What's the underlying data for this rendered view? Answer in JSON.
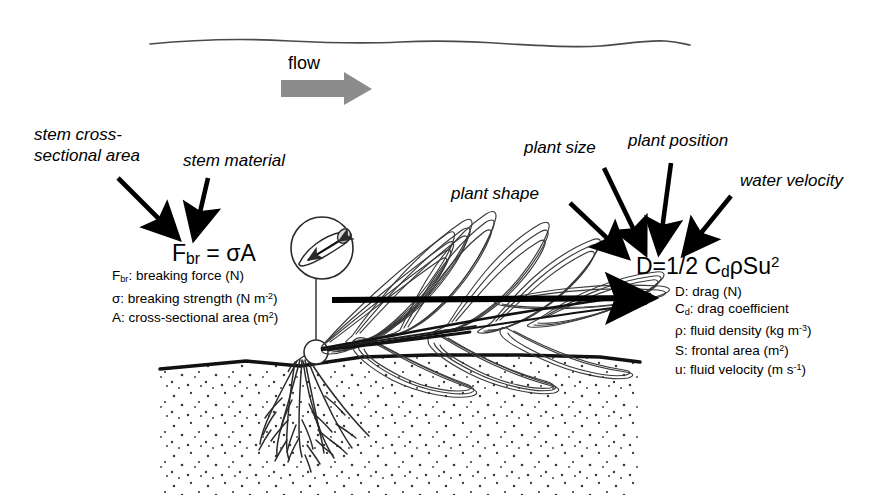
{
  "figure": {
    "background_color": "#ffffff",
    "ink_color": "#000000",
    "flow_arrow_color": "#8c8c8c"
  },
  "flow": {
    "label": "flow",
    "direction": "left-to-right",
    "arrow_name": "flow-arrow"
  },
  "water_surface": {
    "name": "water-surface-line",
    "description": "wavy free surface"
  },
  "substrate": {
    "name": "sediment-bed",
    "description": "stippled sediment with bed line"
  },
  "plant": {
    "name": "seagrass-plant",
    "parts": [
      "leaves",
      "stem",
      "roots"
    ],
    "inset_label": "stem cross-section magnifier"
  },
  "labels": {
    "stem_cross_sectional_area": "stem cross-\nsectional area",
    "stem_material": "stem material",
    "plant_shape": "plant shape",
    "plant_size": "plant size",
    "plant_position": "plant position",
    "water_velocity": "water velocity"
  },
  "breaking_force": {
    "formula_prefix": "F",
    "formula_sub": "br",
    "formula_rest": " = σA",
    "definitions": [
      {
        "symbol": "F",
        "sub": "br",
        "text": ": breaking force (N)"
      },
      {
        "symbol": "σ",
        "sub": "",
        "text": ": breaking strength (N m",
        "sup": "-2",
        "tail": ")"
      },
      {
        "symbol": "A",
        "sub": "",
        "text": ": cross-sectional area (m",
        "sup": "2",
        "tail": ")"
      }
    ]
  },
  "drag": {
    "formula_prefix": "D=1/2 C",
    "formula_sub": "d",
    "formula_rest": "ρSu",
    "formula_sup": "2",
    "definitions": [
      {
        "symbol": "D",
        "sub": "",
        "text": ": drag (N)",
        "sup": "",
        "tail": ""
      },
      {
        "symbol": "C",
        "sub": "d",
        "text": ": drag coefficient",
        "sup": "",
        "tail": ""
      },
      {
        "symbol": "ρ",
        "sub": "",
        "text": ": fluid density (kg m",
        "sup": "-3",
        "tail": ")"
      },
      {
        "symbol": "S",
        "sub": "",
        "text": ": frontal area (m",
        "sup": "2",
        "tail": ")"
      },
      {
        "symbol": "u",
        "sub": "",
        "text": ": fluid velocity (m s",
        "sup": "-1",
        "tail": ")"
      }
    ]
  },
  "arrows": {
    "stem_area_arrow": "pointer from stem cross-sectional area label to breaking force formula",
    "stem_material_arrow": "pointer from stem material label to breaking force formula",
    "plant_shape_arrow": "pointer from plant shape label to drag formula",
    "plant_size_arrow": "pointer from plant size label to drag formula",
    "plant_position_arrow": "pointer from plant position label to drag formula",
    "water_velocity_arrow": "pointer from water velocity label to drag formula",
    "drag_force_arrow": "thick horizontal drag force arrow through plant"
  }
}
